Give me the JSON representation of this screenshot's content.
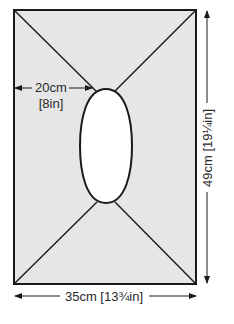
{
  "diagram": {
    "type": "garment-schematic",
    "colors": {
      "fill": "#e6e6e6",
      "stroke": "#1a1a1a",
      "opening": "#ffffff"
    },
    "dimensions": {
      "neck_offset": {
        "cm": "20cm",
        "in": "[8in]"
      },
      "length": {
        "label": "49cm [19¼in]"
      },
      "width": {
        "label": "35cm [13¾in]"
      }
    }
  }
}
